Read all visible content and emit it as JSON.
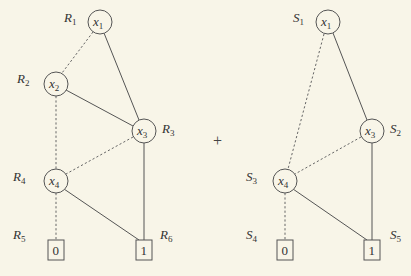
{
  "figure": {
    "operator": "+",
    "style": {
      "background": "#f8f5e8",
      "stroke": "#555555",
      "text": "#333333"
    }
  },
  "left_bdd": {
    "name": "R",
    "nodes": [
      {
        "id": "R1",
        "label_letter": "R",
        "label_index": "1",
        "var_letter": "x",
        "var_index": "1",
        "kind": "variable"
      },
      {
        "id": "R2",
        "label_letter": "R",
        "label_index": "2",
        "var_letter": "x",
        "var_index": "2",
        "kind": "variable"
      },
      {
        "id": "R3",
        "label_letter": "R",
        "label_index": "3",
        "var_letter": "x",
        "var_index": "3",
        "kind": "variable"
      },
      {
        "id": "R4",
        "label_letter": "R",
        "label_index": "4",
        "var_letter": "x",
        "var_index": "4",
        "kind": "variable"
      },
      {
        "id": "R5",
        "label_letter": "R",
        "label_index": "5",
        "value": "0",
        "kind": "terminal"
      },
      {
        "id": "R6",
        "label_letter": "R",
        "label_index": "6",
        "value": "1",
        "kind": "terminal"
      }
    ],
    "edges": [
      {
        "from": "R1",
        "to": "R2",
        "type": "low",
        "style": "dashed"
      },
      {
        "from": "R1",
        "to": "R3",
        "type": "high",
        "style": "solid"
      },
      {
        "from": "R2",
        "to": "R4",
        "type": "low",
        "style": "dashed"
      },
      {
        "from": "R2",
        "to": "R3",
        "type": "high",
        "style": "solid"
      },
      {
        "from": "R3",
        "to": "R4",
        "type": "low",
        "style": "dashed"
      },
      {
        "from": "R3",
        "to": "R6",
        "type": "high",
        "style": "solid"
      },
      {
        "from": "R4",
        "to": "R5",
        "type": "low",
        "style": "dashed"
      },
      {
        "from": "R4",
        "to": "R6",
        "type": "high",
        "style": "solid"
      }
    ]
  },
  "right_bdd": {
    "name": "S",
    "nodes": [
      {
        "id": "S1",
        "label_letter": "S",
        "label_index": "1",
        "var_letter": "x",
        "var_index": "1",
        "kind": "variable"
      },
      {
        "id": "S2",
        "label_letter": "S",
        "label_index": "2",
        "var_letter": "x",
        "var_index": "3",
        "kind": "variable"
      },
      {
        "id": "S3",
        "label_letter": "S",
        "label_index": "3",
        "var_letter": "x",
        "var_index": "4",
        "kind": "variable"
      },
      {
        "id": "S4",
        "label_letter": "S",
        "label_index": "4",
        "value": "0",
        "kind": "terminal"
      },
      {
        "id": "S5",
        "label_letter": "S",
        "label_index": "5",
        "value": "1",
        "kind": "terminal"
      }
    ],
    "edges": [
      {
        "from": "S1",
        "to": "S3",
        "type": "low",
        "style": "dashed"
      },
      {
        "from": "S1",
        "to": "S2",
        "type": "high",
        "style": "solid"
      },
      {
        "from": "S2",
        "to": "S3",
        "type": "low",
        "style": "dashed"
      },
      {
        "from": "S2",
        "to": "S5",
        "type": "high",
        "style": "solid"
      },
      {
        "from": "S3",
        "to": "S4",
        "type": "low",
        "style": "dashed"
      },
      {
        "from": "S3",
        "to": "S5",
        "type": "high",
        "style": "solid"
      }
    ]
  }
}
